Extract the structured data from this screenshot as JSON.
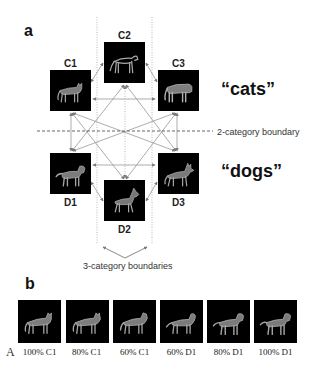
{
  "panel_a": {
    "label": "a",
    "nodes": {
      "C1": {
        "label": "C1",
        "animal": "cat"
      },
      "C2": {
        "label": "C2",
        "animal": "cheetah"
      },
      "C3": {
        "label": "C3",
        "animal": "tiger"
      },
      "D1": {
        "label": "D1",
        "animal": "dog"
      },
      "D2": {
        "label": "D2",
        "animal": "doberman"
      },
      "D3": {
        "label": "D3",
        "animal": "shepherd"
      }
    },
    "category_labels": {
      "cats": "“cats”",
      "dogs": "“dogs”"
    },
    "boundary_2_label": "2-category boundary",
    "boundary_3_label": "3-category boundaries"
  },
  "panel_b": {
    "label": "b",
    "morph_steps": [
      {
        "label": "100% C1"
      },
      {
        "label": "80% C1"
      },
      {
        "label": "60% C1"
      },
      {
        "label": "60% D1"
      },
      {
        "label": "80% D1"
      },
      {
        "label": "100% D1"
      }
    ]
  },
  "corner_mark": "A",
  "colors": {
    "box": "#000000",
    "animal": "#9a9a9a",
    "arrow": "#888888",
    "boundary_line": "#666666"
  }
}
